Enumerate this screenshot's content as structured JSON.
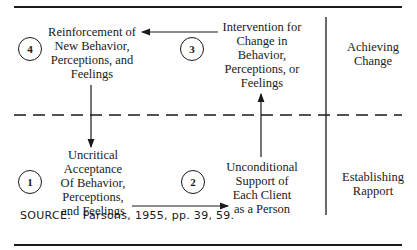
{
  "diagram": {
    "steps": [
      {
        "number": "1",
        "text": [
          "Uncritical",
          "Acceptance",
          "Of Behavior,",
          "Perceptions,",
          "and Feelings"
        ]
      },
      {
        "number": "2",
        "text": [
          "Unconditional",
          "Support of",
          "Each Client",
          "as a Person"
        ]
      },
      {
        "number": "3",
        "text": [
          "Intervention for",
          "Change in",
          "Behavior,",
          "Perceptions, or",
          "Feelings"
        ]
      },
      {
        "number": "4",
        "text": [
          "Reinforcement of",
          "New Behavior,",
          "Perceptions, and",
          "Feelings"
        ]
      }
    ],
    "phases": {
      "top": [
        "Achieving",
        "Change"
      ],
      "bottom": [
        "Establishing",
        "Rapport"
      ]
    },
    "flow": [
      "1 -> 2",
      "2 -> 3",
      "3 -> 4",
      "4 -> 1"
    ],
    "colors": {
      "ink": "#1a1a1a",
      "background": "#ffffff"
    }
  },
  "source": {
    "label": "SOURCE:",
    "citation": "Parsons, 1955, pp. 39, 59."
  }
}
